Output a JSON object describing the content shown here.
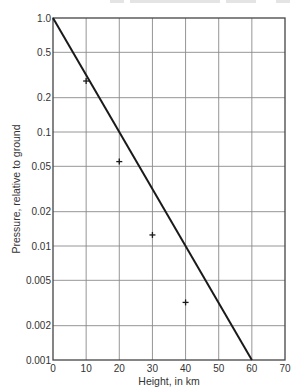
{
  "chart_data": {
    "type": "line",
    "title": "",
    "xlabel": "Height, in km",
    "ylabel": "Pressure, relative to ground",
    "xlim": [
      0,
      70
    ],
    "ylim": [
      0.001,
      1.0
    ],
    "yscale": "log",
    "grid": true,
    "x_ticks": [
      0,
      10,
      20,
      30,
      40,
      50,
      60,
      70
    ],
    "x_tick_labels": [
      "0",
      "10",
      "20",
      "30",
      "40",
      "50",
      "60",
      "70"
    ],
    "y_ticks": [
      1.0,
      0.5,
      0.2,
      0.1,
      0.05,
      0.02,
      0.01,
      0.005,
      0.002,
      0.001
    ],
    "y_tick_labels": [
      "1.0",
      "0.5",
      "0.2",
      "0.1",
      "0.05",
      "0.02",
      "0.01",
      "0.005",
      "0.002",
      "0.001"
    ],
    "series": [
      {
        "name": "Exponential model (straight line)",
        "style": "line",
        "color": "#1a1a1a",
        "x": [
          0,
          60
        ],
        "y": [
          1.0,
          0.001
        ]
      },
      {
        "name": "Observed pressure",
        "style": "plus-markers",
        "color": "#1a1a1a",
        "x": [
          10,
          20,
          30,
          40
        ],
        "y": [
          0.28,
          0.055,
          0.0125,
          0.0032
        ]
      }
    ],
    "legend": null
  }
}
